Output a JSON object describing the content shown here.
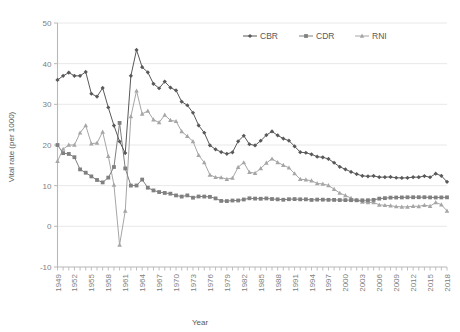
{
  "chart_data": {
    "type": "line",
    "title": "",
    "xlabel": "Year",
    "ylabel": "Vital rate (per 1000)",
    "xlim": [
      1949,
      2018
    ],
    "ylim": [
      -10,
      50
    ],
    "ytick_step": 10,
    "xtick_step": 3,
    "grid": true,
    "legend_position": "top-center",
    "yticks": [
      -10,
      0,
      10,
      20,
      30,
      40,
      50
    ],
    "xticks": [
      1949,
      1952,
      1955,
      1958,
      1961,
      1964,
      1967,
      1970,
      1973,
      1976,
      1979,
      1982,
      1985,
      1988,
      1991,
      1994,
      1997,
      2000,
      2003,
      2006,
      2009,
      2012,
      2015,
      2018
    ],
    "x": [
      1949,
      1950,
      1951,
      1952,
      1953,
      1954,
      1955,
      1956,
      1957,
      1958,
      1959,
      1960,
      1961,
      1962,
      1963,
      1964,
      1965,
      1966,
      1967,
      1968,
      1969,
      1970,
      1971,
      1972,
      1973,
      1974,
      1975,
      1976,
      1977,
      1978,
      1979,
      1980,
      1981,
      1982,
      1983,
      1984,
      1985,
      1986,
      1987,
      1988,
      1989,
      1990,
      1991,
      1992,
      1993,
      1994,
      1995,
      1996,
      1997,
      1998,
      1999,
      2000,
      2001,
      2002,
      2003,
      2004,
      2005,
      2006,
      2007,
      2008,
      2009,
      2010,
      2011,
      2012,
      2013,
      2014,
      2015,
      2016,
      2017,
      2018
    ],
    "series": [
      {
        "name": "CBR",
        "marker": "diamond",
        "color": "#595959",
        "values": [
          36.0,
          37.0,
          37.8,
          37.0,
          37.0,
          37.97,
          32.6,
          31.9,
          34.03,
          29.22,
          24.78,
          20.86,
          18.02,
          37.01,
          43.37,
          39.14,
          37.88,
          35.05,
          33.96,
          35.59,
          34.11,
          33.43,
          30.65,
          29.77,
          27.93,
          24.82,
          23.01,
          19.91,
          18.93,
          18.25,
          17.82,
          18.21,
          20.91,
          22.28,
          20.19,
          19.9,
          21.04,
          22.43,
          23.33,
          22.37,
          21.58,
          21.06,
          19.68,
          18.24,
          18.09,
          17.7,
          17.12,
          16.98,
          16.57,
          15.64,
          14.64,
          14.03,
          13.38,
          12.86,
          12.41,
          12.29,
          12.4,
          12.09,
          12.1,
          12.14,
          11.95,
          11.9,
          11.93,
          12.1,
          12.08,
          12.37,
          12.07,
          12.95,
          12.43,
          10.94
        ]
      },
      {
        "name": "CDR",
        "marker": "square",
        "color": "#808080",
        "values": [
          20.0,
          18.0,
          17.8,
          17.0,
          14.0,
          13.18,
          12.28,
          11.4,
          10.8,
          11.98,
          14.59,
          25.43,
          14.24,
          10.02,
          10.04,
          11.5,
          9.5,
          8.83,
          8.43,
          8.21,
          8.03,
          7.6,
          7.32,
          7.61,
          7.04,
          7.34,
          7.32,
          7.25,
          6.87,
          6.25,
          6.21,
          6.34,
          6.36,
          6.6,
          6.9,
          6.82,
          6.78,
          6.86,
          6.72,
          6.64,
          6.54,
          6.67,
          6.7,
          6.64,
          6.64,
          6.49,
          6.57,
          6.56,
          6.51,
          6.5,
          6.46,
          6.45,
          6.43,
          6.41,
          6.4,
          6.42,
          6.51,
          6.81,
          6.93,
          7.06,
          7.08,
          7.11,
          7.14,
          7.15,
          7.16,
          7.16,
          7.11,
          7.09,
          7.11,
          7.13
        ]
      },
      {
        "name": "RNI",
        "marker": "triangle",
        "color": "#a6a6a6",
        "values": [
          16.0,
          19.0,
          20.0,
          20.0,
          23.0,
          24.79,
          20.32,
          20.5,
          23.23,
          17.24,
          10.19,
          -4.57,
          3.78,
          26.99,
          33.33,
          27.64,
          28.38,
          26.22,
          25.53,
          27.38,
          26.08,
          25.83,
          23.33,
          22.16,
          20.89,
          17.48,
          15.69,
          12.66,
          12.06,
          12.0,
          11.61,
          11.87,
          14.55,
          15.68,
          13.29,
          13.08,
          14.26,
          15.57,
          16.61,
          15.73,
          15.04,
          14.39,
          12.98,
          11.6,
          11.45,
          11.21,
          10.55,
          10.42,
          10.06,
          9.14,
          8.18,
          7.58,
          6.95,
          6.45,
          6.01,
          5.87,
          5.89,
          5.28,
          5.17,
          5.08,
          4.87,
          4.79,
          4.79,
          4.95,
          4.92,
          5.21,
          4.96,
          5.86,
          5.32,
          3.81
        ]
      }
    ]
  },
  "legend": {
    "items": [
      {
        "label": "CBR"
      },
      {
        "label": "CDR"
      },
      {
        "label": "RNI"
      }
    ]
  },
  "axes": {
    "y_title": "Vital rate (per 1000)",
    "x_title": "Year"
  }
}
